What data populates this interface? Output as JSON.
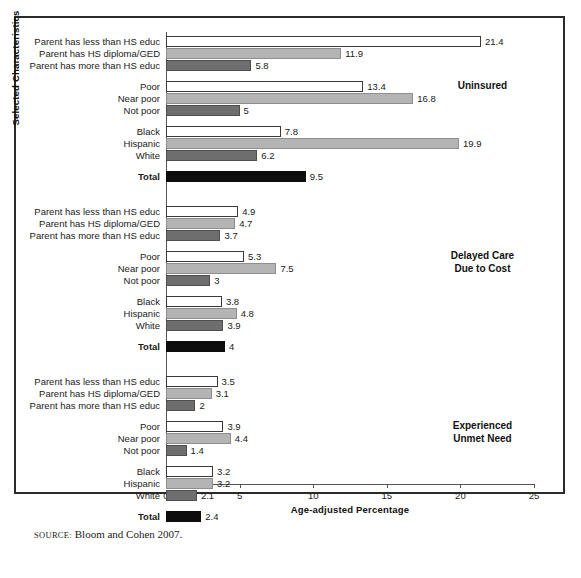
{
  "figure": {
    "y_axis_title": "Selected Characteristics",
    "x_axis_title": "Age-adjusted Percentage",
    "source_kicker": "source:",
    "source_text": "Bloom and Cohen 2007."
  },
  "chart_data": {
    "type": "bar",
    "orientation": "horizontal",
    "title": "",
    "xlabel": "Age-adjusted Percentage",
    "ylabel": "Selected Characteristics",
    "xlim": [
      0,
      25
    ],
    "xticks": [
      0,
      5,
      10,
      15,
      20,
      25
    ],
    "xtick_labels": [
      "0",
      "5",
      "10",
      "15",
      "20",
      "25"
    ],
    "grid": false,
    "legend": "none",
    "series_colors": {
      "white": "#ffffff",
      "light_gray": "#b4b4b4",
      "dark_gray": "#6e6e6e",
      "black": "#0d0d0d"
    },
    "panels": [
      {
        "caption": "Uninsured",
        "groups": [
          {
            "categories": [
              "Parent has less than HS educ",
              "Parent has HS diploma/GED",
              "Parent has more than HS educ"
            ],
            "values": [
              21.4,
              11.9,
              5.8
            ],
            "shades": [
              "white",
              "light",
              "dark"
            ]
          },
          {
            "categories": [
              "Poor",
              "Near poor",
              "Not poor"
            ],
            "values": [
              13.4,
              16.8,
              5
            ],
            "shades": [
              "white",
              "light",
              "dark"
            ]
          },
          {
            "categories": [
              "Black",
              "Hispanic",
              "White"
            ],
            "values": [
              7.8,
              19.9,
              6.2
            ],
            "shades": [
              "white",
              "light",
              "dark"
            ]
          },
          {
            "categories": [
              "Total"
            ],
            "values": [
              9.5
            ],
            "shades": [
              "black"
            ]
          }
        ]
      },
      {
        "caption": "Delayed Care\nDue to Cost",
        "caption_line1": "Delayed Care",
        "caption_line2": "Due to Cost",
        "groups": [
          {
            "categories": [
              "Parent has less than HS educ",
              "Parent has HS diploma/GED",
              "Parent has more than HS educ"
            ],
            "values": [
              4.9,
              4.7,
              3.7
            ],
            "shades": [
              "white",
              "light",
              "dark"
            ]
          },
          {
            "categories": [
              "Poor",
              "Near poor",
              "Not poor"
            ],
            "values": [
              5.3,
              7.5,
              3
            ],
            "shades": [
              "white",
              "light",
              "dark"
            ]
          },
          {
            "categories": [
              "Black",
              "Hispanic",
              "White"
            ],
            "values": [
              3.8,
              4.8,
              3.9
            ],
            "shades": [
              "white",
              "light",
              "dark"
            ]
          },
          {
            "categories": [
              "Total"
            ],
            "values": [
              4
            ],
            "shades": [
              "black"
            ]
          }
        ]
      },
      {
        "caption": "Experienced\nUnmet Need",
        "caption_line1": "Experienced",
        "caption_line2": "Unmet Need",
        "groups": [
          {
            "categories": [
              "Parent has less than HS educ",
              "Parent has HS diploma/GED",
              "Parent has more than HS educ"
            ],
            "values": [
              3.5,
              3.1,
              2
            ],
            "shades": [
              "white",
              "light",
              "dark"
            ]
          },
          {
            "categories": [
              "Poor",
              "Near poor",
              "Not poor"
            ],
            "values": [
              3.9,
              4.4,
              1.4
            ],
            "shades": [
              "white",
              "light",
              "dark"
            ]
          },
          {
            "categories": [
              "Black",
              "Hispanic",
              "White"
            ],
            "values": [
              3.2,
              3.2,
              2.1
            ],
            "shades": [
              "white",
              "light",
              "dark"
            ]
          },
          {
            "categories": [
              "Total"
            ],
            "values": [
              2.4
            ],
            "shades": [
              "black"
            ]
          }
        ]
      }
    ]
  }
}
